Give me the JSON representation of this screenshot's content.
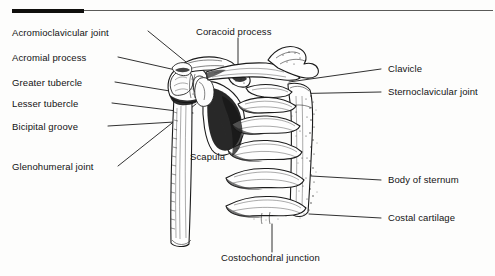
{
  "figure": {
    "background_color": "#fdfdfc",
    "ink_color": "#131313",
    "rule": {
      "thick_segment_color": "#100f0d",
      "thin_segment_color": "#5a5a58"
    }
  },
  "labels_left": [
    {
      "id": "acromioclavicular-joint",
      "text": "Acromioclavicular joint"
    },
    {
      "id": "acromial-process",
      "text": "Acromial process"
    },
    {
      "id": "greater-tubercle",
      "text": "Greater tubercle"
    },
    {
      "id": "lesser-tubercle",
      "text": "Lesser tubercle"
    },
    {
      "id": "bicipital-groove",
      "text": "Bicipital groove"
    },
    {
      "id": "glenohumeral-joint",
      "text": "Glenohumeral joint"
    }
  ],
  "labels_right": [
    {
      "id": "clavicle",
      "text": "Clavicle"
    },
    {
      "id": "sternoclavicular-joint",
      "text": "Sternoclavicular joint"
    },
    {
      "id": "body-of-sternum",
      "text": "Body of sternum"
    },
    {
      "id": "costal-cartilage",
      "text": "Costal cartilage"
    }
  ],
  "labels_top": [
    {
      "id": "coracoid-process",
      "text": "Coracoid process"
    }
  ],
  "labels_inner": [
    {
      "id": "scapula",
      "text": "Scapula"
    }
  ],
  "labels_bottom": [
    {
      "id": "costochondral-junction",
      "text": "Costochondral junction"
    }
  ]
}
